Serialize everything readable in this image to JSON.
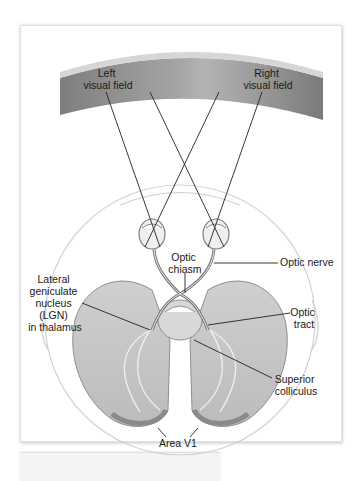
{
  "figure": {
    "labels": {
      "left_visual_field": [
        "Left",
        "visual field"
      ],
      "right_visual_field": [
        "Right",
        "visual field"
      ],
      "optic_chiasm": [
        "Optic",
        "chiasm"
      ],
      "optic_nerve": [
        "Optic nerve"
      ],
      "lgn": [
        "Lateral",
        "geniculate",
        "nucleus",
        "(LGN)",
        "in thalamus"
      ],
      "optic_tract": [
        "Optic",
        "tract"
      ],
      "superior_colliculus": [
        "Superior",
        "colliculus"
      ],
      "area_v1": [
        "Area V1"
      ]
    },
    "colors": {
      "field_band": "#8f8f8f",
      "field_band_light": "#bdbdbd",
      "brain_fill": "#c8c8c8",
      "brain_dark": "#9a9a9a",
      "head_outline": "#cfcfcf",
      "line": "#222222"
    }
  }
}
